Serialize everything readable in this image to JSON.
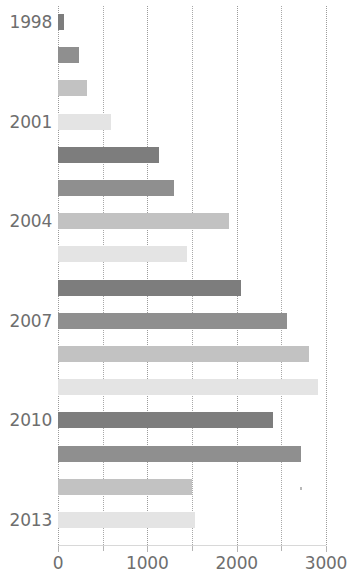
{
  "chart_data": {
    "type": "bar",
    "orientation": "horizontal",
    "title": "",
    "xlabel": "",
    "ylabel": "",
    "xlim": [
      0,
      3000
    ],
    "grid": true,
    "grid_minor_step": 500,
    "legend": null,
    "xticks": [
      0,
      1000,
      2000,
      3000
    ],
    "xtick_labels": [
      "0",
      "1000",
      "2000",
      "3000"
    ],
    "categories": [
      "1998",
      "1999",
      "2000",
      "2001",
      "2002",
      "2003",
      "2004",
      "2005",
      "2006",
      "2007",
      "2008",
      "2009",
      "2010",
      "2011",
      "2012",
      "2013"
    ],
    "visible_category_labels": [
      "1998",
      "2001",
      "2004",
      "2007",
      "2010",
      "2013"
    ],
    "values": [
      70,
      235,
      330,
      590,
      1135,
      1300,
      1915,
      1440,
      2045,
      2565,
      2810,
      2915,
      2410,
      2715,
      1500,
      1535
    ],
    "bar_colors": [
      "#7d7d7d",
      "#8f8f8f",
      "#c2c2c2",
      "#e4e4e4",
      "#7d7d7d",
      "#8f8f8f",
      "#c2c2c2",
      "#e4e4e4",
      "#7d7d7d",
      "#8f8f8f",
      "#c2c2c2",
      "#e4e4e4",
      "#7d7d7d",
      "#8f8f8f",
      "#c2c2c2",
      "#e4e4e4"
    ],
    "axis_color": "#d8d8d8",
    "gridline_color": "#9a9a9a",
    "tick_label_color": "#6e6e6e"
  }
}
